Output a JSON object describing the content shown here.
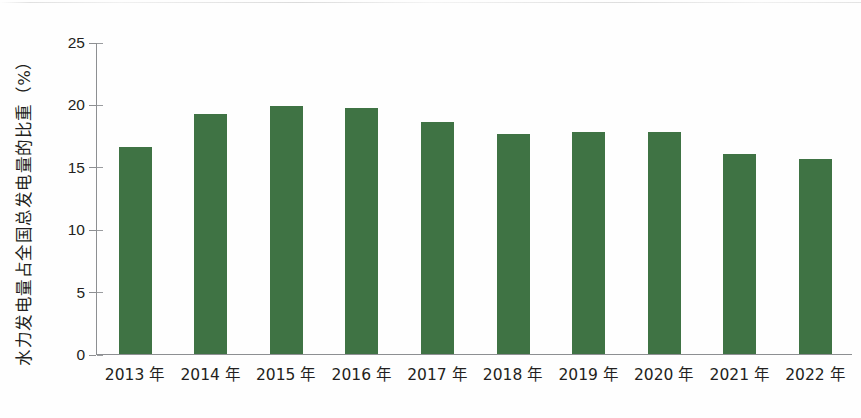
{
  "chart_data": {
    "type": "bar",
    "title": "",
    "subtitle": "",
    "xlabel": "",
    "ylabel": "水力发电量占全国总发电量的比重（%）",
    "categories": [
      "2013 年",
      "2014 年",
      "2015 年",
      "2016 年",
      "2017 年",
      "2018 年",
      "2019 年",
      "2020 年",
      "2021 年",
      "2022 年"
    ],
    "values": [
      16.6,
      19.2,
      19.9,
      19.7,
      18.6,
      17.6,
      17.8,
      17.8,
      16.0,
      15.6
    ],
    "unit": "%",
    "ylim": [
      0,
      25
    ],
    "yticks": [
      0,
      5,
      10,
      15,
      20,
      25
    ],
    "ytick_labels": [
      "0",
      "5",
      "10",
      "15",
      "20",
      "25"
    ],
    "grid": false,
    "legend": "none",
    "series_color": "#3f7344",
    "axis_color": "#8d8f92",
    "text_color": "#231f20",
    "background": "#ffffff",
    "bar_width_px": 33
  }
}
